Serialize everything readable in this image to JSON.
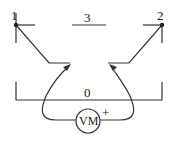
{
  "diagram": {
    "nodes": [
      {
        "id": "node-1",
        "label": "1"
      },
      {
        "id": "node-2",
        "label": "2"
      },
      {
        "id": "node-3",
        "label": "3"
      },
      {
        "id": "node-0",
        "label": "0"
      }
    ],
    "meter": {
      "label": "VM",
      "polarity": "+"
    },
    "colors": {
      "line": "#333333",
      "background": "#ffffff"
    }
  }
}
